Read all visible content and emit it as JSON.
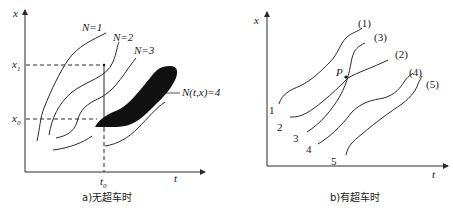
{
  "panel_a": {
    "caption": "a)无超车时",
    "axis_y_label": "x",
    "axis_x_label": "t",
    "tick_x1": "x",
    "tick_x1_sub": "1",
    "tick_x0": "x",
    "tick_x0_sub": "0",
    "tick_t0": "t",
    "tick_t0_sub": "0",
    "curve_labels": [
      "N=1",
      "N=2",
      "N=3"
    ],
    "blob_label": "N(t,x)=4"
  },
  "panel_b": {
    "caption": "b)有超车时",
    "axis_y_label": "x",
    "axis_x_label": "t",
    "point_label": "P",
    "start_labels": [
      "1",
      "2",
      "3",
      "4",
      "5"
    ],
    "end_labels": [
      "(1)",
      "(3)",
      "(2)",
      "(4)",
      "(5)"
    ]
  }
}
